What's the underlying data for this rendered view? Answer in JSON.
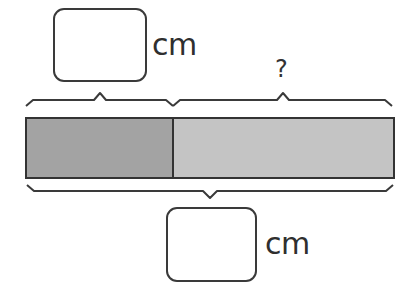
{
  "diagram": {
    "type": "tape-diagram",
    "top_label": {
      "answer_box": "",
      "unit": "cm"
    },
    "unknown_label": "?",
    "bottom_label": {
      "answer_box": "",
      "unit": "cm"
    },
    "bar": {
      "segments": [
        {
          "name": "known-part",
          "color": "#a3a3a3",
          "x_start": 26,
          "x_end": 173
        },
        {
          "name": "unknown-part",
          "color": "#c4c4c4",
          "x_start": 173,
          "x_end": 394
        }
      ],
      "outline_color": "#3a3a3a"
    }
  }
}
